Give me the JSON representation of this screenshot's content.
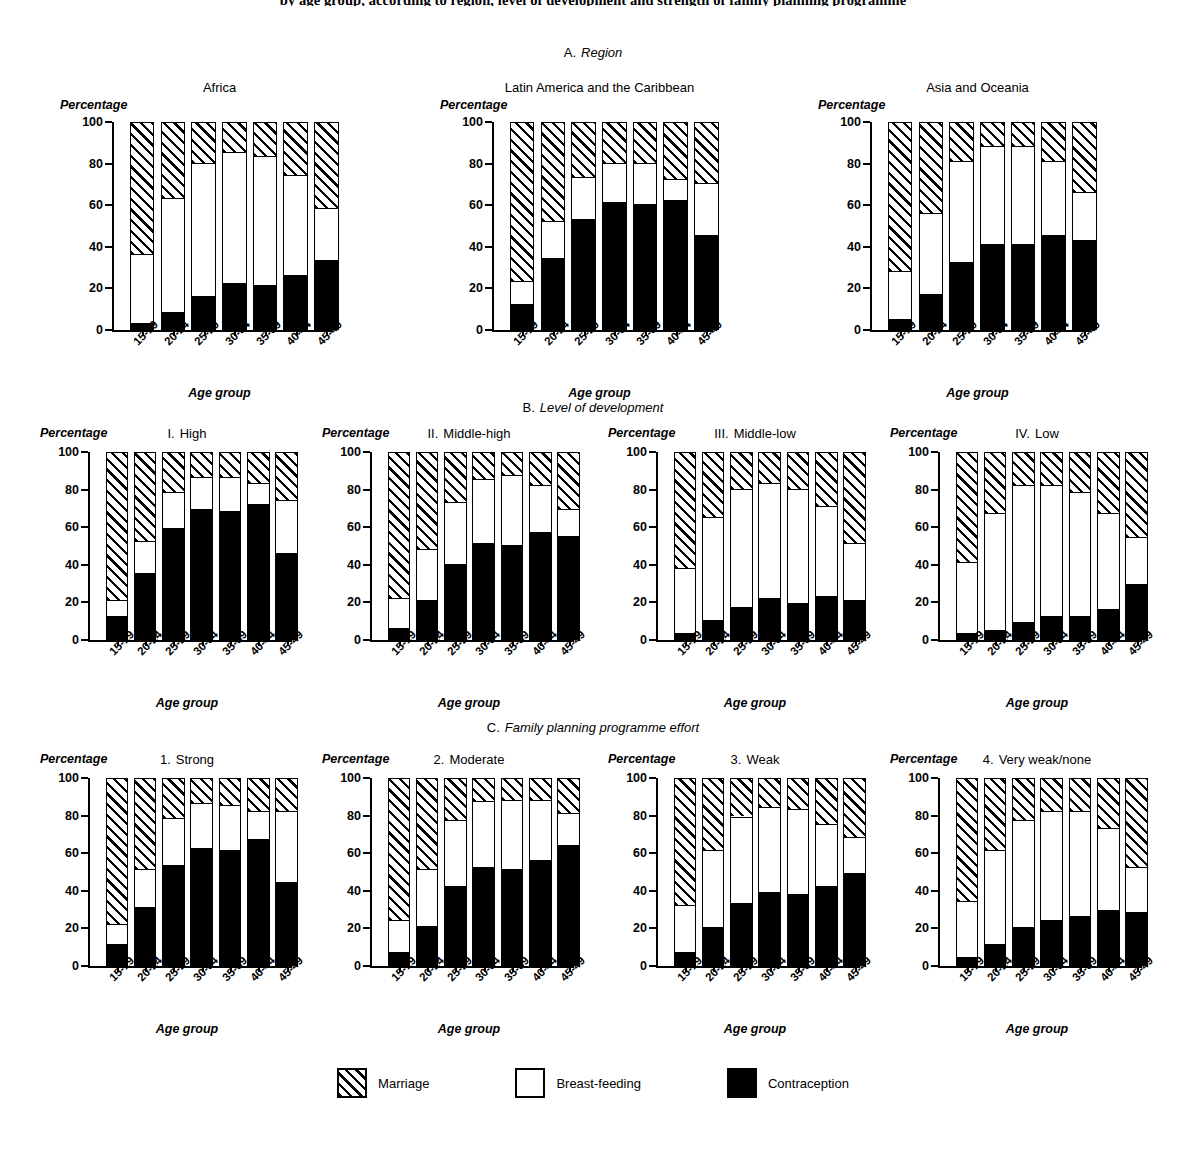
{
  "figure": {
    "title": "by age group, according to region, level of development and strength of family planning programme",
    "axis_title_x": "Age group",
    "axis_title_y": "Percentage",
    "y_ticks": [
      0,
      20,
      40,
      60,
      80,
      100
    ],
    "ylim": [
      0,
      100
    ]
  },
  "sections": [
    {
      "letter": "A.",
      "name": "Region"
    },
    {
      "letter": "B.",
      "name": "Level of development"
    },
    {
      "letter": "C.",
      "name": "Family planning programme effort"
    }
  ],
  "legend": {
    "items": [
      {
        "key": "marriage",
        "label": "Marriage",
        "fill": "hatched",
        "color": "#000000"
      },
      {
        "key": "breastfeeding",
        "label": "Breast-feeding",
        "fill": "white",
        "color": "#ffffff"
      },
      {
        "key": "contraception",
        "label": "Contraception",
        "fill": "solid",
        "color": "#000000"
      }
    ]
  },
  "chart_data": {
    "type": "bar",
    "stacked": true,
    "xlabel": "Age group",
    "ylabel": "Percentage",
    "ylim": [
      0,
      100
    ],
    "yticks": [
      0,
      20,
      40,
      60,
      80,
      100
    ],
    "grid": false,
    "legend_position": "bottom-center",
    "categories": [
      "15-19",
      "20-24",
      "25-29",
      "30-34",
      "35-39",
      "40-44",
      "45-49"
    ],
    "series_names": [
      "Contraception",
      "Breast-feeding",
      "Marriage"
    ],
    "panels": [
      {
        "section": "A. Region",
        "panel_number": "",
        "panel_title": "Africa",
        "series": [
          {
            "name": "Contraception",
            "values": [
              3,
              8,
              16,
              22,
              21,
              26,
              33
            ]
          },
          {
            "name": "Breast-feeding",
            "values": [
              33,
              55,
              64,
              63,
              62,
              48,
              25
            ]
          },
          {
            "name": "Marriage",
            "values": [
              64,
              37,
              20,
              15,
              17,
              26,
              42
            ]
          }
        ],
        "cumulative_tops": {
          "contraception": [
            3,
            8,
            16,
            22,
            21,
            26,
            33
          ],
          "breastfeeding": [
            36,
            63,
            80,
            85,
            83,
            74,
            58
          ]
        }
      },
      {
        "section": "A. Region",
        "panel_number": "",
        "panel_title": "Latin America and the Caribbean",
        "series": [
          {
            "name": "Contraception",
            "values": [
              12,
              34,
              53,
              61,
              60,
              62,
              45
            ]
          },
          {
            "name": "Breast-feeding",
            "values": [
              11,
              18,
              20,
              19,
              20,
              10,
              25
            ]
          },
          {
            "name": "Marriage",
            "values": [
              77,
              48,
              27,
              20,
              20,
              28,
              30
            ]
          }
        ],
        "cumulative_tops": {
          "contraception": [
            12,
            34,
            53,
            61,
            60,
            62,
            45
          ],
          "breastfeeding": [
            23,
            52,
            73,
            80,
            80,
            72,
            70
          ]
        }
      },
      {
        "section": "A. Region",
        "panel_number": "",
        "panel_title": "Asia and Oceania",
        "series": [
          {
            "name": "Contraception",
            "values": [
              5,
              17,
              32,
              41,
              41,
              45,
              43
            ]
          },
          {
            "name": "Breast-feeding",
            "values": [
              23,
              39,
              49,
              47,
              47,
              36,
              23
            ]
          },
          {
            "name": "Marriage",
            "values": [
              72,
              44,
              19,
              12,
              12,
              19,
              34
            ]
          }
        ],
        "cumulative_tops": {
          "contraception": [
            5,
            17,
            32,
            41,
            41,
            45,
            43
          ],
          "breastfeeding": [
            28,
            56,
            81,
            88,
            88,
            81,
            66
          ]
        }
      },
      {
        "section": "B. Level of development",
        "panel_number": "I.",
        "panel_title": "High",
        "series": [
          {
            "name": "Contraception",
            "values": [
              12,
              35,
              59,
              69,
              68,
              72,
              46
            ]
          },
          {
            "name": "Breast-feeding",
            "values": [
              9,
              17,
              19,
              17,
              18,
              11,
              28
            ]
          },
          {
            "name": "Marriage",
            "values": [
              79,
              48,
              22,
              14,
              14,
              17,
              26
            ]
          }
        ],
        "cumulative_tops": {
          "contraception": [
            12,
            35,
            59,
            69,
            68,
            72,
            46
          ],
          "breastfeeding": [
            21,
            52,
            78,
            86,
            86,
            83,
            74
          ]
        }
      },
      {
        "section": "B. Level of development",
        "panel_number": "II.",
        "panel_title": "Middle-high",
        "series": [
          {
            "name": "Contraception",
            "values": [
              6,
              21,
              40,
              51,
              50,
              57,
              55
            ]
          },
          {
            "name": "Breast-feeding",
            "values": [
              16,
              27,
              33,
              34,
              37,
              25,
              14
            ]
          },
          {
            "name": "Marriage",
            "values": [
              78,
              52,
              27,
              15,
              13,
              18,
              31
            ]
          }
        ],
        "cumulative_tops": {
          "contraception": [
            6,
            21,
            40,
            51,
            50,
            57,
            55
          ],
          "breastfeeding": [
            22,
            48,
            73,
            85,
            87,
            82,
            69
          ]
        }
      },
      {
        "section": "B. Level of development",
        "panel_number": "III.",
        "panel_title": "Middle-low",
        "series": [
          {
            "name": "Contraception",
            "values": [
              3,
              10,
              17,
              22,
              19,
              23,
              21
            ]
          },
          {
            "name": "Breast-feeding",
            "values": [
              35,
              55,
              63,
              61,
              61,
              48,
              30
            ]
          },
          {
            "name": "Marriage",
            "values": [
              62,
              35,
              20,
              17,
              20,
              29,
              49
            ]
          }
        ],
        "cumulative_tops": {
          "contraception": [
            3,
            10,
            17,
            22,
            19,
            23,
            21
          ],
          "breastfeeding": [
            38,
            65,
            80,
            83,
            80,
            71,
            51
          ]
        }
      },
      {
        "section": "B. Level of development",
        "panel_number": "IV.",
        "panel_title": "Low",
        "series": [
          {
            "name": "Contraception",
            "values": [
              3,
              5,
              9,
              12,
              12,
              16,
              29
            ]
          },
          {
            "name": "Breast-feeding",
            "values": [
              38,
              62,
              73,
              70,
              66,
              51,
              25
            ]
          },
          {
            "name": "Marriage",
            "values": [
              59,
              33,
              18,
              18,
              22,
              33,
              46
            ]
          }
        ],
        "cumulative_tops": {
          "contraception": [
            3,
            5,
            9,
            12,
            12,
            16,
            29
          ],
          "breastfeeding": [
            41,
            67,
            82,
            82,
            78,
            67,
            54
          ]
        }
      },
      {
        "section": "C. Family planning programme effort",
        "panel_number": "1.",
        "panel_title": "Strong",
        "series": [
          {
            "name": "Contraception",
            "values": [
              11,
              31,
              53,
              62,
              61,
              67,
              44
            ]
          },
          {
            "name": "Breast-feeding",
            "values": [
              11,
              20,
              25,
              24,
              24,
              15,
              38
            ]
          },
          {
            "name": "Marriage",
            "values": [
              78,
              49,
              22,
              14,
              15,
              18,
              18
            ]
          }
        ],
        "cumulative_tops": {
          "contraception": [
            11,
            31,
            53,
            62,
            61,
            67,
            44
          ],
          "breastfeeding": [
            22,
            51,
            78,
            86,
            85,
            82,
            82
          ]
        }
      },
      {
        "section": "C. Family planning programme effort",
        "panel_number": "2.",
        "panel_title": "Moderate",
        "series": [
          {
            "name": "Contraception",
            "values": [
              7,
              21,
              42,
              52,
              51,
              56,
              64
            ]
          },
          {
            "name": "Breast-feeding",
            "values": [
              17,
              30,
              35,
              35,
              37,
              32,
              17
            ]
          },
          {
            "name": "Marriage",
            "values": [
              76,
              49,
              23,
              13,
              12,
              12,
              19
            ]
          }
        ],
        "cumulative_tops": {
          "contraception": [
            7,
            21,
            42,
            52,
            51,
            56,
            64
          ],
          "breastfeeding": [
            24,
            51,
            77,
            87,
            88,
            88,
            81
          ]
        }
      },
      {
        "section": "C. Family planning programme effort",
        "panel_number": "3.",
        "panel_title": "Weak",
        "series": [
          {
            "name": "Contraception",
            "values": [
              7,
              20,
              33,
              39,
              38,
              42,
              49
            ]
          },
          {
            "name": "Breast-feeding",
            "values": [
              25,
              41,
              46,
              45,
              45,
              33,
              19
            ]
          },
          {
            "name": "Marriage",
            "values": [
              68,
              39,
              21,
              16,
              17,
              25,
              32
            ]
          }
        ],
        "cumulative_tops": {
          "contraception": [
            7,
            20,
            33,
            39,
            38,
            42,
            49
          ],
          "breastfeeding": [
            32,
            61,
            79,
            84,
            83,
            75,
            68
          ]
        }
      },
      {
        "section": "C. Family planning programme effort",
        "panel_number": "4.",
        "panel_title": "Very weak/none",
        "series": [
          {
            "name": "Contraception",
            "values": [
              4,
              11,
              20,
              24,
              26,
              29,
              28
            ]
          },
          {
            "name": "Breast-feeding",
            "values": [
              30,
              50,
              57,
              58,
              56,
              44,
              24
            ]
          },
          {
            "name": "Marriage",
            "values": [
              66,
              39,
              23,
              18,
              18,
              27,
              48
            ]
          }
        ],
        "cumulative_tops": {
          "contraception": [
            4,
            11,
            20,
            24,
            26,
            29,
            28
          ],
          "breastfeeding": [
            34,
            61,
            77,
            82,
            82,
            73,
            52
          ]
        }
      }
    ]
  }
}
